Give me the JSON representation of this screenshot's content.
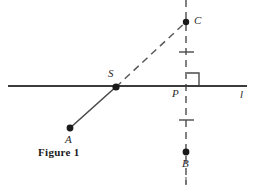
{
  "figure": {
    "caption": "Figure 1",
    "line_label": "l",
    "points": [
      {
        "id": "C",
        "label": "C",
        "x": 186,
        "y": 22
      },
      {
        "id": "S",
        "label": "S",
        "x": 116,
        "y": 87
      },
      {
        "id": "P",
        "label": "P",
        "x": 186,
        "y": 86
      },
      {
        "id": "A",
        "label": "A",
        "x": 70,
        "y": 128
      },
      {
        "id": "B",
        "label": "B",
        "x": 186,
        "y": 152
      }
    ],
    "colors": {
      "stroke": "#4a4a4a",
      "line": "#3c3c3c",
      "dot": "#1a1a1a",
      "text": "#2b2b2b",
      "background": "#ffffff"
    },
    "elements": {
      "horizontal_line": {
        "x1": 8,
        "y1": 86,
        "x2": 247,
        "y2": 86
      },
      "vertical_dashed_line": {
        "x1": 186,
        "y1": 0,
        "x2": 186,
        "y2": 185
      },
      "segment_AS": {
        "x1": 70,
        "y1": 128,
        "x2": 116,
        "y2": 87
      },
      "ray_SC_dashed": {
        "x1": 116,
        "y1": 87,
        "x2": 186,
        "y2": 22
      },
      "tick_upper": {
        "x1": 179,
        "y1": 52,
        "x2": 194,
        "y2": 52
      },
      "tick_lower": {
        "x1": 179,
        "y1": 120,
        "x2": 194,
        "y2": 120
      },
      "right_angle_square": {
        "x": 187,
        "y": 73,
        "size": 12
      }
    }
  }
}
